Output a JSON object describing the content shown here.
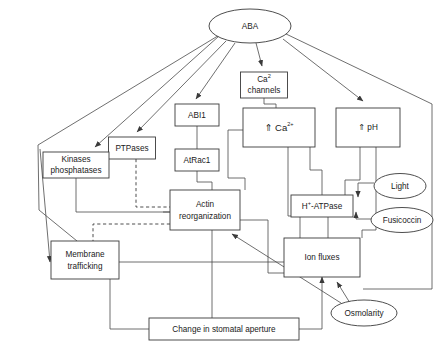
{
  "diagram": {
    "type": "flowchart",
    "background_color": "#ffffff",
    "line_color": "#4a4a4a",
    "text_color": "#1a1a1a",
    "nodes": [
      {
        "id": "aba",
        "shape": "ellipse",
        "label": "ABA",
        "x": 250,
        "y": 26,
        "w": 82,
        "h": 34
      },
      {
        "id": "ca_channels",
        "shape": "box",
        "label": "Ca",
        "label2": "channels",
        "sup": "2",
        "x": 264,
        "y": 85,
        "w": 47,
        "h": 26
      },
      {
        "id": "abi1",
        "shape": "box",
        "label": "ABI1",
        "x": 197,
        "y": 115,
        "w": 44,
        "h": 22
      },
      {
        "id": "ca_up",
        "shape": "box",
        "label": "⇑ Ca",
        "sup": "2+",
        "x": 279,
        "y": 127,
        "w": 72,
        "h": 39
      },
      {
        "id": "ph_up",
        "shape": "box",
        "label": "⇑ pH",
        "x": 368,
        "y": 127,
        "w": 64,
        "h": 39
      },
      {
        "id": "ptpases",
        "shape": "box",
        "label": "PTPases",
        "x": 132,
        "y": 148,
        "w": 47,
        "h": 22
      },
      {
        "id": "kinases",
        "shape": "box",
        "label": "Kinases",
        "label2": "phosphatases",
        "x": 76,
        "y": 165,
        "w": 66,
        "h": 26
      },
      {
        "id": "atrac1",
        "shape": "box",
        "label": "AtRac1",
        "x": 197,
        "y": 160,
        "w": 44,
        "h": 22
      },
      {
        "id": "actin",
        "shape": "box",
        "label": "Actin",
        "label2": "reorganization",
        "x": 205,
        "y": 210,
        "w": 70,
        "h": 40
      },
      {
        "id": "hatpase",
        "shape": "box",
        "label": "H",
        "label2b": "-ATPase",
        "sup": "+",
        "x": 322,
        "y": 206,
        "w": 62,
        "h": 22
      },
      {
        "id": "light",
        "shape": "ellipse",
        "label": "Light",
        "x": 400,
        "y": 186,
        "w": 52,
        "h": 25
      },
      {
        "id": "fusicoccin",
        "shape": "ellipse",
        "label": "Fusicoccin",
        "x": 402,
        "y": 220,
        "w": 62,
        "h": 25
      },
      {
        "id": "ion_fluxes",
        "shape": "box",
        "label": "Ion fluxes",
        "x": 322,
        "y": 257,
        "w": 76,
        "h": 39
      },
      {
        "id": "membrane",
        "shape": "box",
        "label": "Membrane",
        "label2": "trafficking",
        "x": 85,
        "y": 260,
        "w": 68,
        "h": 38
      },
      {
        "id": "osmolarity",
        "shape": "ellipse",
        "label": "Osmolarity",
        "x": 364,
        "y": 313,
        "w": 66,
        "h": 26
      },
      {
        "id": "aperture",
        "shape": "box",
        "label": "Change in stomatal aperture",
        "x": 224,
        "y": 329,
        "w": 150,
        "h": 22
      }
    ],
    "edges": [
      {
        "from": "aba",
        "to": "kinases",
        "style": "solid",
        "arrow": true
      },
      {
        "from": "aba",
        "to": "ptpases",
        "style": "solid",
        "arrow": true
      },
      {
        "from": "aba",
        "to": "abi1",
        "style": "solid",
        "arrow": true
      },
      {
        "from": "aba",
        "to": "ca_channels",
        "style": "solid",
        "arrow": true
      },
      {
        "from": "aba",
        "to": "ph_up",
        "style": "solid",
        "arrow": true
      },
      {
        "from": "aba",
        "to": "membrane",
        "style": "solid",
        "arrow": true
      },
      {
        "from": "ca_channels",
        "to": "ca_up",
        "style": "solid",
        "arrow": false
      },
      {
        "from": "abi1",
        "to": "atrac1",
        "style": "solid",
        "arrow": false
      },
      {
        "from": "atrac1",
        "to": "actin",
        "style": "solid",
        "arrow": false
      },
      {
        "from": "ptpases",
        "to": "actin",
        "style": "dashed",
        "arrow": false
      },
      {
        "from": "ptpases",
        "to": "membrane",
        "style": "dashed",
        "arrow": false
      },
      {
        "from": "kinases",
        "to": "actin",
        "style": "solid",
        "arrow": false
      },
      {
        "from": "ca_up",
        "to": "actin",
        "style": "solid",
        "arrow": false
      },
      {
        "from": "ca_up",
        "to": "ion_fluxes",
        "style": "solid",
        "arrow": false
      },
      {
        "from": "ph_up",
        "to": "hatpase",
        "style": "solid",
        "arrow": false
      },
      {
        "from": "light",
        "to": "hatpase",
        "style": "solid",
        "arrow": true
      },
      {
        "from": "fusicoccin",
        "to": "hatpase",
        "style": "solid",
        "arrow": true
      },
      {
        "from": "hatpase",
        "to": "ion_fluxes",
        "style": "solid",
        "arrow": false
      },
      {
        "from": "osmolarity",
        "to": "ion_fluxes",
        "style": "solid",
        "arrow": true
      },
      {
        "from": "osmolarity",
        "to": "actin",
        "style": "solid",
        "arrow": true
      },
      {
        "from": "actin",
        "to": "aperture",
        "style": "solid",
        "arrow": false
      },
      {
        "from": "ion_fluxes",
        "to": "aperture",
        "style": "solid",
        "arrow": false
      },
      {
        "from": "membrane",
        "to": "aperture",
        "style": "solid",
        "arrow": false
      },
      {
        "from": "membrane",
        "to": "ion_fluxes",
        "style": "solid",
        "arrow": false
      },
      {
        "from": "aperture",
        "to": "ion_fluxes",
        "style": "solid",
        "arrow": true
      }
    ]
  }
}
